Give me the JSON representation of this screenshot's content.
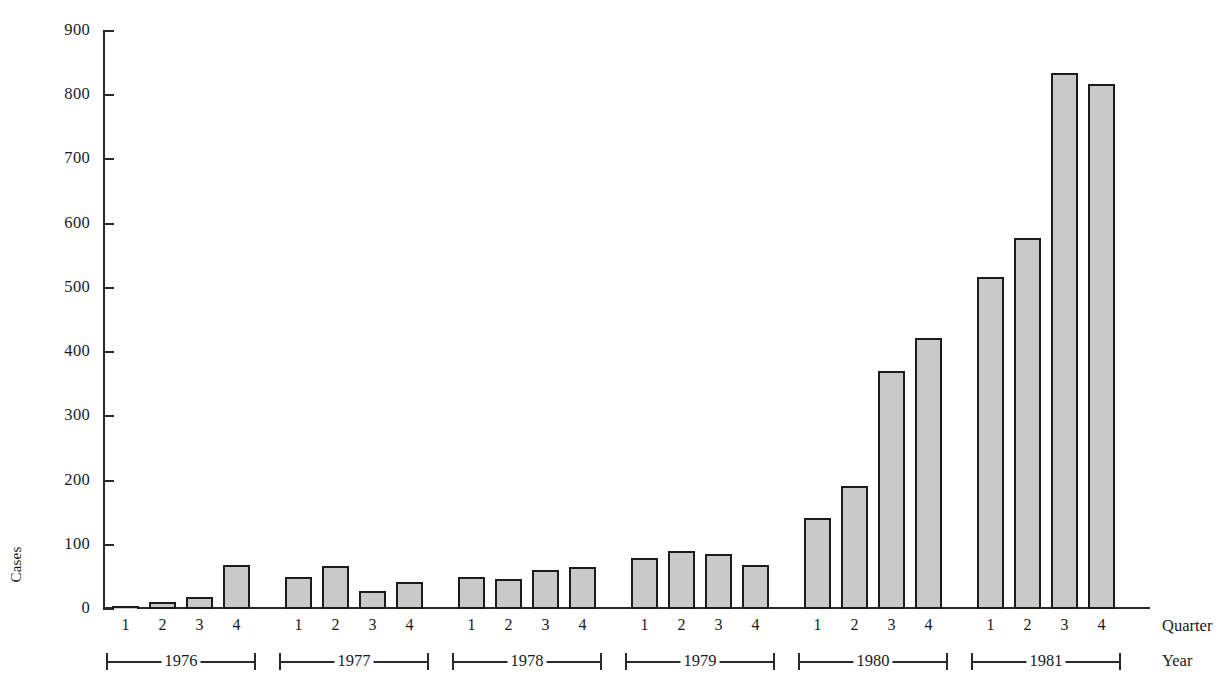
{
  "chart_data": {
    "type": "bar",
    "title": "",
    "xlabel": "Quarter",
    "ylabel": "Cases",
    "secondary_xlabel": "Year",
    "ylim": [
      0,
      900
    ],
    "ytick_step": 100,
    "yticks": [
      0,
      100,
      200,
      300,
      400,
      500,
      600,
      700,
      800,
      900
    ],
    "ytick_labels": [
      "0",
      "100",
      "200",
      "300",
      "400",
      "500",
      "600",
      "700",
      "800",
      "900"
    ],
    "grid": false,
    "legend": false,
    "bar_fill_color": "#c9c9c9",
    "bar_edge_color": "#1c1c1c",
    "categories": [
      "1976 Q1",
      "1976 Q2",
      "1976 Q3",
      "1976 Q4",
      "1977 Q1",
      "1977 Q2",
      "1977 Q3",
      "1977 Q4",
      "1978 Q1",
      "1978 Q2",
      "1978 Q3",
      "1978 Q4",
      "1979 Q1",
      "1979 Q2",
      "1979 Q3",
      "1979 Q4",
      "1980 Q1",
      "1980 Q2",
      "1980 Q3",
      "1980 Q4",
      "1981 Q1",
      "1981 Q2",
      "1981 Q3",
      "1981 Q4"
    ],
    "quarter_labels": [
      "1",
      "2",
      "3",
      "4",
      "1",
      "2",
      "3",
      "4",
      "1",
      "2",
      "3",
      "4",
      "1",
      "2",
      "3",
      "4",
      "1",
      "2",
      "3",
      "4",
      "1",
      "2",
      "3",
      "4"
    ],
    "values": [
      2,
      11,
      19,
      69,
      50,
      67,
      28,
      42,
      50,
      46,
      60,
      66,
      80,
      91,
      86,
      68,
      141,
      191,
      370,
      422,
      517,
      577,
      835,
      818
    ],
    "year_groups": [
      {
        "label": "1976",
        "quarters": [
          "1",
          "2",
          "3",
          "4"
        ]
      },
      {
        "label": "1977",
        "quarters": [
          "1",
          "2",
          "3",
          "4"
        ]
      },
      {
        "label": "1978",
        "quarters": [
          "1",
          "2",
          "3",
          "4"
        ]
      },
      {
        "label": "1979",
        "quarters": [
          "1",
          "2",
          "3",
          "4"
        ]
      },
      {
        "label": "1980",
        "quarters": [
          "1",
          "2",
          "3",
          "4"
        ]
      },
      {
        "label": "1981",
        "quarters": [
          "1",
          "2",
          "3",
          "4"
        ]
      }
    ]
  }
}
